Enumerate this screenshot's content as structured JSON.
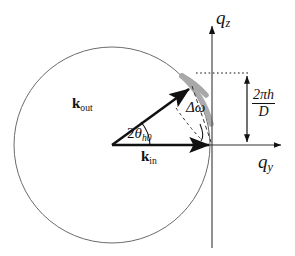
{
  "figure": {
    "type": "vector-diagram",
    "background": "#ffffff",
    "stroke_color": "#111111",
    "circle_color": "#6b6b6b",
    "arc_highlight_color": "#a8a8a8",
    "dash_color": "#333333"
  },
  "axes": {
    "vertical": {
      "label_q": "q",
      "label_sub": "z",
      "x": 212,
      "y_top": 22,
      "y_bottom": 248
    },
    "horizontal": {
      "label_q": "q",
      "label_sub": "y",
      "y": 145,
      "x_left": 112,
      "x_right": 283
    }
  },
  "circle": {
    "center_x": 112,
    "center_y": 145,
    "radius": 98,
    "description": "Ewald sphere cross-section"
  },
  "vectors": [
    {
      "name": "k-out",
      "label_bold": "k",
      "label_sub": "out",
      "from_x": 112,
      "from_y": 145,
      "to_x": 192,
      "to_y": 87
    },
    {
      "name": "k-in",
      "label_bold": "k",
      "label_sub": "in",
      "from_x": 112,
      "from_y": 145,
      "to_x": 212,
      "to_y": 145
    }
  ],
  "angles": [
    {
      "name": "two-theta-h0",
      "prefix": "2",
      "symbol": "θ",
      "subscript": "h0",
      "full_label": "2θh0"
    },
    {
      "name": "delta-omega",
      "symbol": "Δω",
      "full_label": "Δω"
    }
  ],
  "measurement": {
    "name": "reciprocal-lattice-spacing",
    "numerator": "2πh",
    "denominator": "D",
    "full_label": "2πh/D",
    "arrow_x": 247,
    "arrow_y_top": 73,
    "arrow_y_bottom": 145,
    "dotted_line_y": 73,
    "dotted_line_x_start": 196,
    "dotted_line_x_end": 250
  },
  "annotations": {
    "gray_arc": {
      "name": "scattering-arc",
      "color": "#a8a8a8",
      "description": "thick gray arc along the Ewald sphere from the k-out arrowhead to the qz axis"
    },
    "dashed_lines": {
      "name": "delta-omega-construction",
      "description": "dashed line from k-out arrowhead toward the origin-axis intersection and dashed arc marking delta omega"
    }
  }
}
